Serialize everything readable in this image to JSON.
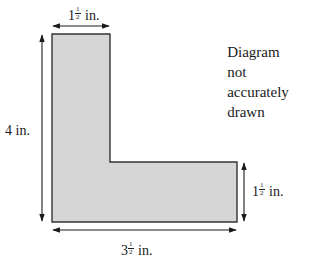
{
  "diagram": {
    "type": "L-shaped figure with dimension arrows",
    "colors": {
      "fill": "#d6d6d6",
      "stroke": "#333333",
      "arrow": "#1a1a1a"
    },
    "labels": {
      "top_width": {
        "whole": "1",
        "num": "1",
        "den": "2",
        "unit": "in."
      },
      "left_height": {
        "text": "4 in."
      },
      "right_height": {
        "whole": "1",
        "num": "1",
        "den": "2",
        "unit": "in."
      },
      "bottom_width": {
        "whole": "3",
        "num": "1",
        "den": "2",
        "unit": "in."
      }
    },
    "note": {
      "line1": "Diagram not",
      "line2": "accurately drawn"
    }
  }
}
